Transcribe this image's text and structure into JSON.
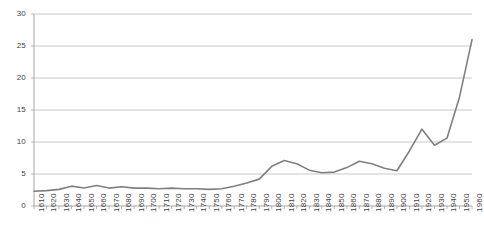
{
  "chart_data": {
    "type": "line",
    "title": "",
    "subtitle": "",
    "xlabel": "",
    "ylabel": "",
    "categories": [
      "1610",
      "1620",
      "1630",
      "1640",
      "1650",
      "1660",
      "1670",
      "1680",
      "1690",
      "1700",
      "1710",
      "1720",
      "1730",
      "1740",
      "1750",
      "1760",
      "1770",
      "1780",
      "1790",
      "1800",
      "1810",
      "1820",
      "1830",
      "1840",
      "1850",
      "1860",
      "1870",
      "1880",
      "1890",
      "1900",
      "1910",
      "1920",
      "1930",
      "1940",
      "1950",
      "1960"
    ],
    "values": [
      2.3,
      2.4,
      2.6,
      3.1,
      2.8,
      3.2,
      2.8,
      3.0,
      2.8,
      2.8,
      2.7,
      2.8,
      2.7,
      2.7,
      2.6,
      2.7,
      3.1,
      3.6,
      4.2,
      6.2,
      7.1,
      6.6,
      5.6,
      5.2,
      5.3,
      6.0,
      7.0,
      6.6,
      5.9,
      5.5,
      8.6,
      12.0,
      9.5,
      10.6,
      17.0,
      26.0
    ],
    "ylim": [
      0,
      30
    ],
    "yticks": [
      0,
      5,
      10,
      15,
      20,
      25,
      30
    ],
    "ytick_labels": [
      "0",
      "5",
      "10",
      "15",
      "20",
      "25",
      "30"
    ],
    "grid": true,
    "grid_axis": "y",
    "legend": false,
    "legend_position": "none",
    "series": [
      {
        "name": "series-1",
        "color": "#808080",
        "values": [
          2.3,
          2.4,
          2.6,
          3.1,
          2.8,
          3.2,
          2.8,
          3.0,
          2.8,
          2.8,
          2.7,
          2.8,
          2.7,
          2.7,
          2.6,
          2.7,
          3.1,
          3.6,
          4.2,
          6.2,
          7.1,
          6.6,
          5.6,
          5.2,
          5.3,
          6.0,
          7.0,
          6.6,
          5.9,
          5.5,
          8.6,
          12.0,
          9.5,
          10.6,
          17.0,
          26.0
        ]
      }
    ]
  },
  "style": {
    "line_color": "#808080",
    "grid_color": "#c9c9c9",
    "axis_color": "#a6a6a6",
    "tick_color": "#b5b5b5",
    "label_color": "#3f3f3f",
    "background": "#ffffff"
  },
  "geometry": {
    "plot_left": 34,
    "plot_right": 472,
    "plot_top": 14,
    "plot_bottom": 206,
    "xlabel_top": 212
  }
}
